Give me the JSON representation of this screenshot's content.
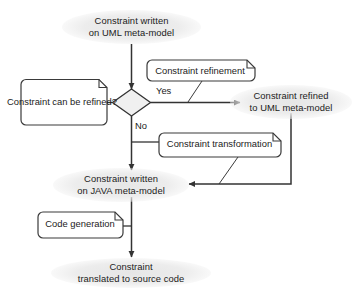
{
  "diagram": {
    "colors": {
      "stroke": "#333333",
      "note_stroke": "#3a3a3a",
      "note_fill": "#ffffff",
      "decision_fill": "#f0f0f0",
      "text": "#1b1b1b",
      "halo": "#e8e8e8",
      "background": "#ffffff"
    },
    "start_label": {
      "id": "constraint-written-uml",
      "text": "Constraint written\non UML meta-model"
    },
    "decision": {
      "id": "constraint-can-be-refined",
      "note_text": "Constraint can\nbe refined?",
      "shape": "diamond",
      "branches": [
        {
          "id": "yes-branch",
          "label": "Yes",
          "target": "constraint-refined-uml"
        },
        {
          "id": "no-branch",
          "label": "No",
          "target": "constraint-written-java"
        }
      ]
    },
    "notes": [
      {
        "id": "constraint-refinement",
        "text": "Constraint refinement"
      },
      {
        "id": "constraint-transformation",
        "text": "Constraint transformation"
      },
      {
        "id": "code-generation",
        "text": "Code generation"
      }
    ],
    "states": [
      {
        "id": "constraint-refined-uml",
        "text": "Constraint refined\nto UML meta-model"
      },
      {
        "id": "constraint-written-java",
        "text": "Constraint written\non JAVA meta-model"
      },
      {
        "id": "constraint-translated-source",
        "text": "Constraint\ntranslated to source code"
      }
    ]
  }
}
